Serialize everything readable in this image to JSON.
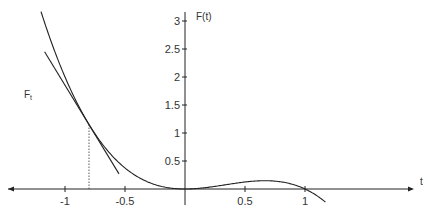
{
  "chart_data": {
    "type": "line",
    "title": "",
    "xlabel": "t",
    "ylabel": "F(t)",
    "curve_label": "F_t",
    "xlim": [
      -1.45,
      1.95
    ],
    "ylim": [
      -0.3,
      3.2
    ],
    "grid": false,
    "x_ticks": [
      {
        "value": -1,
        "label": "-1"
      },
      {
        "value": -0.5,
        "label": "-0.5"
      },
      {
        "value": 0.5,
        "label": "0.5"
      },
      {
        "value": 1,
        "label": "1"
      }
    ],
    "y_ticks": [
      {
        "value": 0.5,
        "label": "0.5"
      },
      {
        "value": 1,
        "label": "1"
      },
      {
        "value": 1.5,
        "label": "1.5"
      },
      {
        "value": 2,
        "label": "2"
      },
      {
        "value": 2.5,
        "label": "2.5"
      },
      {
        "value": 3,
        "label": "3"
      }
    ],
    "series": [
      {
        "name": "F(t)",
        "formula": "t^2 (1 - t)",
        "t_range": [
          -1.2,
          1.17
        ],
        "x": [
          -1.2,
          -1.0,
          -0.8,
          -0.6,
          -0.4,
          -0.2,
          0,
          0.2,
          0.4,
          0.6,
          0.67,
          0.8,
          1.0,
          1.17
        ],
        "y": [
          3.17,
          2.0,
          1.15,
          0.58,
          0.22,
          0.05,
          0,
          0.03,
          0.1,
          0.14,
          0.15,
          0.13,
          0,
          -0.23
        ]
      },
      {
        "name": "tangent line",
        "tangent_at": -0.8,
        "slope": -3.52,
        "x": [
          -1.17,
          -0.55
        ],
        "y": [
          2.45,
          0.27
        ]
      }
    ],
    "annotations": [
      {
        "type": "dotted-vertical",
        "x": -0.8,
        "y_from": 0,
        "y_to": 1.15
      }
    ]
  }
}
